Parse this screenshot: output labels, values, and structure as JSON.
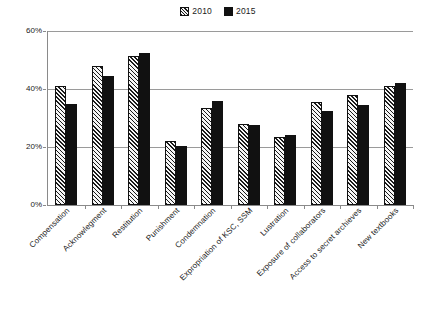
{
  "chart_data": {
    "type": "bar",
    "title": "",
    "subtitle": "",
    "xlabel": "",
    "ylabel": "",
    "ylim": [
      0,
      60
    ],
    "ytick_labels": [
      "0%",
      "20%",
      "40%",
      "60%"
    ],
    "ytick_values": [
      0,
      20,
      40,
      60
    ],
    "grid": true,
    "legend_position": "top-center",
    "categories": [
      "Compensation",
      "Acknowlegment",
      "Restitution",
      "Punishment",
      "Condemnation",
      "Expropriation of KSC, SSM",
      "Lustration",
      "Exposure of collaborators",
      "Access to secret archieves",
      "New textbooks"
    ],
    "series": [
      {
        "name": "2010",
        "color": "#f2f2f2",
        "pattern": "diagonal-hatch",
        "values": [
          41,
          48,
          51.5,
          22,
          33.5,
          28,
          23.5,
          35.5,
          38,
          41
        ]
      },
      {
        "name": "2015",
        "color": "#111111",
        "pattern": "solid",
        "values": [
          35,
          44.5,
          52.5,
          20.5,
          36,
          27.5,
          24,
          32.5,
          34.5,
          42
        ]
      }
    ]
  },
  "legend": {
    "entries": [
      {
        "label": "2010",
        "swatch": "hatched-square-icon"
      },
      {
        "label": "2015",
        "swatch": "solid-square-icon"
      }
    ]
  }
}
